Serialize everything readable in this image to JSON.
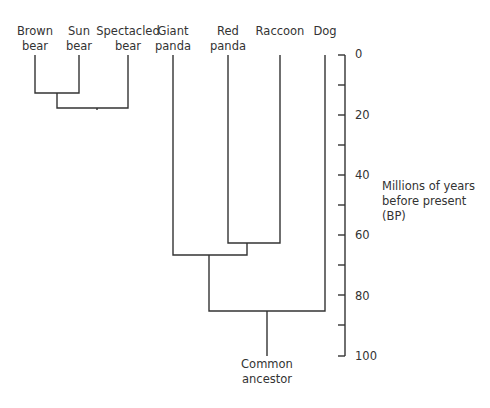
{
  "diagram": {
    "type": "phylogenetic-tree",
    "taxa": [
      {
        "line1": "Brown",
        "line2": "bear",
        "x": 35
      },
      {
        "line1": "Sun",
        "line2": "bear",
        "x": 79
      },
      {
        "line1": "Spectacled",
        "line2": "bear",
        "x": 128
      },
      {
        "line1": "Giant",
        "line2": "panda",
        "x": 173
      },
      {
        "line1": "Red",
        "line2": "panda",
        "x": 228
      },
      {
        "line1": "Raccoon",
        "line2": "",
        "x": 280
      },
      {
        "line1": "Dog",
        "line2": "",
        "x": 325
      }
    ],
    "root": {
      "line1": "Common",
      "line2": "ancestor"
    },
    "axis": {
      "title_line1": "Millions of years",
      "title_line2": "before present",
      "title_line3": "(BP)",
      "ticks": [
        "0",
        "20",
        "40",
        "60",
        "80",
        "100"
      ],
      "min": 0,
      "max": 100,
      "minor_step": 10
    },
    "divergences_mya": [
      {
        "clade": "Brown bear + Sun bear",
        "time": 13
      },
      {
        "clade": "(Brown + Sun) + Spectacled bear",
        "time": 18
      },
      {
        "clade": "Red panda + Raccoon",
        "time": 62
      },
      {
        "clade": "Bears + Giant panda",
        "time": 66
      },
      {
        "clade": "Bears/Pandas + Raccoon group",
        "time": 66
      },
      {
        "clade": "All + Dog",
        "time": 85
      }
    ],
    "line_color": "#333333"
  }
}
